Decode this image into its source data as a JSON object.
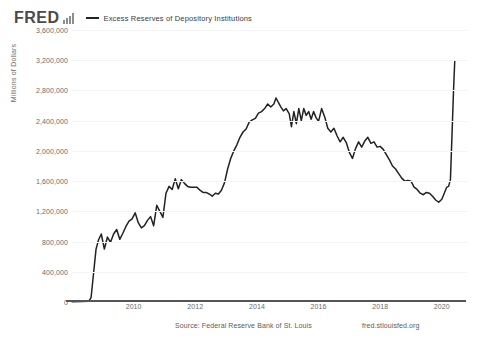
{
  "brand": {
    "logo_text": "FRED",
    "logo_mark_icon": "bar-chart-icon"
  },
  "legend": {
    "items": [
      {
        "label": "Excess Reserves of Depository Institutions",
        "color": "#222222"
      }
    ]
  },
  "footer": {
    "source": "Source: Federal Reserve Bank of St. Louis",
    "url": "fred.stlouisfed.org"
  },
  "chart_data": {
    "type": "line",
    "title": "Excess Reserves of Depository Institutions",
    "xlabel": "",
    "ylabel": "Millions of Dollars",
    "ylim": [
      0,
      3600000
    ],
    "xlim": [
      2008.0,
      2020.85
    ],
    "grid": true,
    "legend_position": "top",
    "ytick_labels": [
      "0",
      "400,000",
      "800,000",
      "1,200,000",
      "1,600,000",
      "2,000,000",
      "2,400,000",
      "2,800,000",
      "3,200,000",
      "3,600,000"
    ],
    "ytick_values": [
      0,
      400000,
      800000,
      1200000,
      1600000,
      2000000,
      2400000,
      2800000,
      3200000,
      3600000
    ],
    "xtick_labels": [
      "2010",
      "2012",
      "2014",
      "2016",
      "2018",
      "2020"
    ],
    "xtick_values": [
      2010,
      2012,
      2014,
      2016,
      2018,
      2020
    ],
    "series": [
      {
        "name": "Excess Reserves of Depository Institutions",
        "color": "#222222",
        "x": [
          2008.0,
          2008.3,
          2008.55,
          2008.62,
          2008.7,
          2008.78,
          2008.86,
          2008.95,
          2009.05,
          2009.15,
          2009.25,
          2009.35,
          2009.45,
          2009.55,
          2009.65,
          2009.75,
          2009.85,
          2009.95,
          2010.05,
          2010.15,
          2010.25,
          2010.35,
          2010.45,
          2010.55,
          2010.65,
          2010.75,
          2010.85,
          2010.95,
          2011.05,
          2011.15,
          2011.25,
          2011.35,
          2011.45,
          2011.55,
          2011.65,
          2011.75,
          2011.85,
          2011.95,
          2012.05,
          2012.15,
          2012.25,
          2012.35,
          2012.45,
          2012.55,
          2012.65,
          2012.75,
          2012.85,
          2012.95,
          2013.05,
          2013.15,
          2013.25,
          2013.35,
          2013.45,
          2013.55,
          2013.65,
          2013.75,
          2013.85,
          2013.95,
          2014.05,
          2014.15,
          2014.25,
          2014.35,
          2014.45,
          2014.55,
          2014.62,
          2014.7,
          2014.78,
          2014.86,
          2014.95,
          2015.05,
          2015.12,
          2015.2,
          2015.28,
          2015.36,
          2015.44,
          2015.52,
          2015.6,
          2015.68,
          2015.76,
          2015.84,
          2015.92,
          2016.0,
          2016.1,
          2016.2,
          2016.3,
          2016.4,
          2016.5,
          2016.6,
          2016.7,
          2016.8,
          2016.9,
          2017.0,
          2017.1,
          2017.2,
          2017.3,
          2017.4,
          2017.5,
          2017.6,
          2017.7,
          2017.8,
          2017.9,
          2018.0,
          2018.1,
          2018.2,
          2018.3,
          2018.4,
          2018.5,
          2018.6,
          2018.7,
          2018.8,
          2018.9,
          2019.0,
          2019.1,
          2019.2,
          2019.3,
          2019.4,
          2019.5,
          2019.6,
          2019.7,
          2019.8,
          2019.9,
          2020.0,
          2020.08,
          2020.16,
          2020.22,
          2020.28,
          2020.33,
          2020.38,
          2020.42
        ],
        "y": [
          2000,
          5000,
          10000,
          60000,
          380000,
          700000,
          820000,
          900000,
          700000,
          860000,
          790000,
          900000,
          960000,
          830000,
          910000,
          1000000,
          1070000,
          1100000,
          1180000,
          1050000,
          980000,
          1010000,
          1080000,
          1130000,
          1010000,
          1280000,
          1200000,
          1120000,
          1440000,
          1530000,
          1490000,
          1630000,
          1500000,
          1620000,
          1570000,
          1530000,
          1520000,
          1520000,
          1520000,
          1480000,
          1450000,
          1450000,
          1430000,
          1400000,
          1440000,
          1430000,
          1480000,
          1580000,
          1760000,
          1900000,
          2000000,
          2080000,
          2180000,
          2250000,
          2290000,
          2380000,
          2410000,
          2430000,
          2500000,
          2520000,
          2560000,
          2620000,
          2580000,
          2620000,
          2700000,
          2640000,
          2580000,
          2530000,
          2560000,
          2490000,
          2320000,
          2520000,
          2360000,
          2560000,
          2400000,
          2560000,
          2470000,
          2520000,
          2420000,
          2520000,
          2440000,
          2390000,
          2560000,
          2450000,
          2300000,
          2250000,
          2300000,
          2200000,
          2120000,
          2180000,
          2110000,
          1980000,
          1900000,
          2030000,
          2120000,
          2050000,
          2130000,
          2180000,
          2100000,
          2120000,
          2050000,
          2060000,
          2020000,
          1950000,
          1880000,
          1800000,
          1760000,
          1700000,
          1640000,
          1600000,
          1610000,
          1600000,
          1520000,
          1490000,
          1440000,
          1420000,
          1450000,
          1440000,
          1400000,
          1350000,
          1320000,
          1360000,
          1440000,
          1520000,
          1530000,
          1620000,
          2200000,
          2800000,
          3190000
        ]
      }
    ]
  }
}
